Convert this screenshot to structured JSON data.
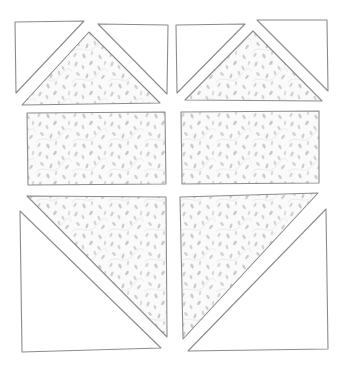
{
  "diagram": {
    "title": "Quilt block layout (unsewn pieces)",
    "background": "#ffffff",
    "outline_color": "#8c8c8c",
    "fabric": {
      "name": "leaf-print",
      "base_color": "#fafafa",
      "speck_color": "#c9c9c9",
      "vine_color": "#e4e4e4"
    },
    "rows": [
      {
        "name": "top-row",
        "units": [
          {
            "name": "flying-geese-left",
            "pieces": [
              {
                "type": "white-triangle",
                "points": "15,22 84,21 16,93"
              },
              {
                "type": "fabric-triangle",
                "points": "89,32 160,103 22,105"
              },
              {
                "type": "white-triangle",
                "points": "98,24 168,25 167,94"
              }
            ]
          },
          {
            "name": "flying-geese-right",
            "pieces": [
              {
                "type": "white-triangle",
                "points": "176,25 245,24 177,93"
              },
              {
                "type": "fabric-triangle",
                "points": "253,31 322,101 185,100"
              },
              {
                "type": "white-triangle",
                "points": "257,20 327,20 328,91"
              }
            ]
          }
        ]
      },
      {
        "name": "middle-row",
        "units": [
          {
            "name": "rectangle-left",
            "pieces": [
              {
                "type": "fabric-rectangle",
                "points": "27,113 165,112 166,184 28,185"
              }
            ]
          },
          {
            "name": "rectangle-right",
            "pieces": [
              {
                "type": "fabric-rectangle",
                "points": "181,112 319,111 319,183 182,184"
              }
            ]
          }
        ]
      },
      {
        "name": "bottom-row",
        "units": [
          {
            "name": "half-square-triangle-left",
            "pieces": [
              {
                "type": "fabric-triangle",
                "points": "27,196 166,197 167,337"
              },
              {
                "type": "white-triangle",
                "points": "20,211 161,348 22,352"
              }
            ]
          },
          {
            "name": "half-square-triangle-right",
            "pieces": [
              {
                "type": "fabric-triangle",
                "points": "180,197 318,193 183,339"
              },
              {
                "type": "white-triangle",
                "points": "326,209 328,349 188,351"
              }
            ]
          }
        ]
      }
    ]
  }
}
